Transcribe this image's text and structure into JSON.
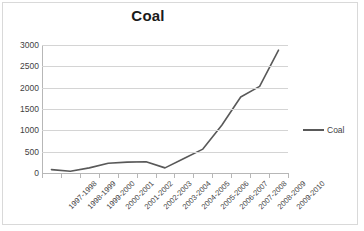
{
  "chart": {
    "title": "Coal",
    "legend_label": "Coal",
    "legend_icon": "line-swatch-icon"
  },
  "chart_data": {
    "type": "line",
    "title": "Coal",
    "xlabel": "",
    "ylabel": "",
    "categories": [
      "1997-1998",
      "1998-1999",
      "1999-2000",
      "2000-2001",
      "2001-2002",
      "2002-2003",
      "2003-2004",
      "2004-2005",
      "2005-2006",
      "2006-2007",
      "2007-2008",
      "2008-2009",
      "2009-2010"
    ],
    "series": [
      {
        "name": "Coal",
        "color": "#595959",
        "values": [
          80,
          40,
          120,
          230,
          255,
          265,
          120,
          340,
          560,
          1120,
          1780,
          2030,
          2880
        ]
      }
    ],
    "ylim": [
      0,
      3000
    ],
    "ytick_values": [
      0,
      500,
      1000,
      1500,
      2000,
      2500,
      3000
    ],
    "ytick_labels": [
      "0",
      "500",
      "1000",
      "1500",
      "2000",
      "2500",
      "3000"
    ],
    "grid": "horizontal",
    "legend_position": "right",
    "xlabel_rotation": -45
  }
}
